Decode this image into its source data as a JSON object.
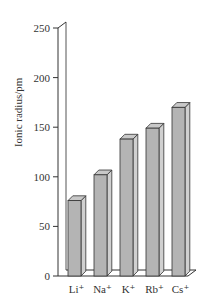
{
  "chart_data": {
    "type": "bar",
    "style": "3d",
    "title": "",
    "xlabel": "",
    "ylabel": "Ionic radius/pm",
    "ylim": [
      0,
      250
    ],
    "yticks": [
      0,
      50,
      100,
      150,
      200,
      250
    ],
    "grid": false,
    "legend": null,
    "categories": [
      "Li⁺",
      "Na⁺",
      "K⁺",
      "Rb⁺",
      "Cs⁺"
    ],
    "values": [
      76,
      102,
      138,
      149,
      170
    ],
    "bar_color": "#b4b4b4",
    "bar_side_color": "#d0d0d0",
    "bar_top_color": "#c8c8c8",
    "outline_color": "#333333"
  }
}
